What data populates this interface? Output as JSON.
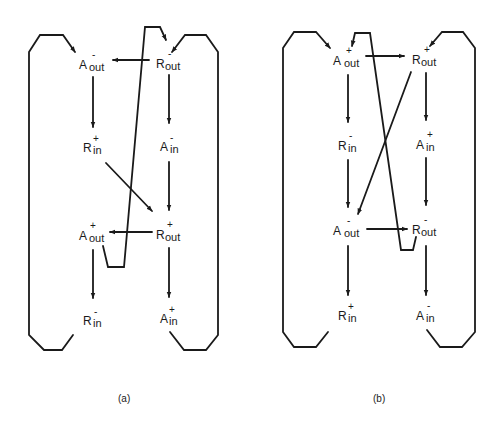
{
  "figure": {
    "panels": [
      {
        "id": "a",
        "caption": "(a)",
        "nodes": [
          {
            "id": "a_aout_minus",
            "base": "A",
            "sub": "out",
            "sign": "-",
            "x": 80,
            "y": 68
          },
          {
            "id": "a_rout_minus",
            "base": "R",
            "sub": "out",
            "sign": "-",
            "x": 157,
            "y": 68
          },
          {
            "id": "a_rin_plus",
            "base": "R",
            "sub": "in",
            "sign": "+",
            "x": 83,
            "y": 152
          },
          {
            "id": "a_ain_minus",
            "base": "A",
            "sub": "in",
            "sign": "-",
            "x": 160,
            "y": 152
          },
          {
            "id": "a_aout_plus",
            "base": "A",
            "sub": "out",
            "sign": "+",
            "x": 80,
            "y": 240
          },
          {
            "id": "a_rout_plus",
            "base": "R",
            "sub": "out",
            "sign": "+",
            "x": 157,
            "y": 240
          },
          {
            "id": "a_rin_minus",
            "base": "R",
            "sub": "in",
            "sign": "-",
            "x": 83,
            "y": 326
          },
          {
            "id": "a_ain_plus",
            "base": "A",
            "sub": "in",
            "sign": "+",
            "x": 160,
            "y": 324
          }
        ],
        "edges": [
          {
            "from": "R_out-",
            "to": "A_out-"
          },
          {
            "from": "A_out-",
            "to": "R_in+"
          },
          {
            "from": "R_out-",
            "to": "A_in-"
          },
          {
            "from": "R_in+",
            "to": "R_out+"
          },
          {
            "from": "A_in-",
            "to": "R_out+"
          },
          {
            "from": "R_out+",
            "to": "A_out+"
          },
          {
            "from": "A_out+",
            "to": "R_out-"
          },
          {
            "from": "A_out+",
            "to": "R_in-"
          },
          {
            "from": "R_out+",
            "to": "A_in+"
          },
          {
            "from": "R_in-",
            "to": "A_out-"
          },
          {
            "from": "A_in+",
            "to": "R_out-"
          }
        ]
      },
      {
        "id": "b",
        "caption": "(b)",
        "nodes": [
          {
            "id": "b_aout_plus",
            "base": "A",
            "sub": "out",
            "sign": "+",
            "x": 334,
            "y": 64
          },
          {
            "id": "b_rout_plus",
            "base": "R",
            "sub": "out",
            "sign": "+",
            "x": 413,
            "y": 64
          },
          {
            "id": "b_rin_minus",
            "base": "R",
            "sub": "in",
            "sign": "-",
            "x": 338,
            "y": 150
          },
          {
            "id": "b_ain_plus",
            "base": "A",
            "sub": "in",
            "sign": "+",
            "x": 416,
            "y": 150
          },
          {
            "id": "b_aout_minus",
            "base": "A",
            "sub": "out",
            "sign": "-",
            "x": 334,
            "y": 235
          },
          {
            "id": "b_rout_minus",
            "base": "R",
            "sub": "out",
            "sign": "-",
            "x": 413,
            "y": 235
          },
          {
            "id": "b_rin_plus",
            "base": "R",
            "sub": "in",
            "sign": "+",
            "x": 338,
            "y": 321
          },
          {
            "id": "b_ain_minus",
            "base": "A",
            "sub": "in",
            "sign": "-",
            "x": 416,
            "y": 321
          }
        ],
        "edges": [
          {
            "from": "A_out+",
            "to": "R_out+"
          },
          {
            "from": "A_out+",
            "to": "R_in-"
          },
          {
            "from": "R_out+",
            "to": "A_in+"
          },
          {
            "from": "R_out+",
            "to": "A_out-"
          },
          {
            "from": "R_in-",
            "to": "A_out-"
          },
          {
            "from": "A_in+",
            "to": "R_out-"
          },
          {
            "from": "A_out-",
            "to": "R_out-"
          },
          {
            "from": "R_out-",
            "to": "A_out+"
          },
          {
            "from": "A_out-",
            "to": "R_in+"
          },
          {
            "from": "R_out-",
            "to": "A_in-"
          },
          {
            "from": "R_in+",
            "to": "A_out+"
          },
          {
            "from": "A_in-",
            "to": "R_out+"
          }
        ]
      }
    ]
  },
  "labels": {
    "a": {
      "n1": {
        "base": "A",
        "sign": "-",
        "sub": "out"
      },
      "n2": {
        "base": "R",
        "sign": "-",
        "sub": "out"
      },
      "n3": {
        "base": "R",
        "sign": "+",
        "sub": "in"
      },
      "n4": {
        "base": "A",
        "sign": "-",
        "sub": "in"
      },
      "n5": {
        "base": "A",
        "sign": "+",
        "sub": "out"
      },
      "n6": {
        "base": "R",
        "sign": "+",
        "sub": "out"
      },
      "n7": {
        "base": "R",
        "sign": "-",
        "sub": "in"
      },
      "n8": {
        "base": "A",
        "sign": "+",
        "sub": "in"
      },
      "caption": "(a)"
    },
    "b": {
      "n1": {
        "base": "A",
        "sign": "+",
        "sub": "out"
      },
      "n2": {
        "base": "R",
        "sign": "+",
        "sub": "out"
      },
      "n3": {
        "base": "R",
        "sign": "-",
        "sub": "in"
      },
      "n4": {
        "base": "A",
        "sign": "+",
        "sub": "in"
      },
      "n5": {
        "base": "A",
        "sign": "-",
        "sub": "out"
      },
      "n6": {
        "base": "R",
        "sign": "-",
        "sub": "out"
      },
      "n7": {
        "base": "R",
        "sign": "+",
        "sub": "in"
      },
      "n8": {
        "base": "A",
        "sign": "-",
        "sub": "in"
      },
      "caption": "(b)"
    }
  },
  "colors": {
    "ink": "#1a1a1a",
    "background": "#ffffff"
  }
}
